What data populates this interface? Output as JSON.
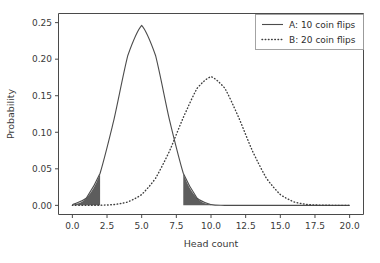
{
  "chart_data": {
    "type": "line",
    "title": "",
    "xlabel": "Head count",
    "ylabel": "Probability",
    "xlim": [
      -1.0,
      21.0
    ],
    "ylim": [
      -0.0125,
      0.2625
    ],
    "grid": false,
    "legend_position": "upper right",
    "xticks": [
      "0.0",
      "2.5",
      "5.0",
      "7.5",
      "10.0",
      "12.5",
      "15.0",
      "17.5",
      "20.0"
    ],
    "xtick_values": [
      0.0,
      2.5,
      5.0,
      7.5,
      10.0,
      12.5,
      15.0,
      17.5,
      20.0
    ],
    "yticks": [
      "0.00",
      "0.05",
      "0.10",
      "0.15",
      "0.20",
      "0.25"
    ],
    "ytick_values": [
      0.0,
      0.05,
      0.1,
      0.15,
      0.2,
      0.25
    ],
    "series": [
      {
        "name": "A: 10 coin flips",
        "style": "solid",
        "color": "#4c4c4c",
        "x": [
          0,
          1,
          2,
          3,
          4,
          5,
          6,
          7,
          8,
          9,
          10,
          11,
          12,
          13,
          14,
          15,
          16,
          17,
          18,
          19,
          20
        ],
        "values": [
          0.000977,
          0.009766,
          0.043945,
          0.117188,
          0.205078,
          0.246094,
          0.205078,
          0.117188,
          0.043945,
          0.009766,
          0.000977,
          0,
          0,
          0,
          0,
          0,
          0,
          0,
          0,
          0,
          0
        ]
      },
      {
        "name": "B: 20 coin flips",
        "style": "dotted",
        "color": "#3d3d3d",
        "x": [
          0,
          1,
          2,
          3,
          4,
          5,
          6,
          7,
          8,
          9,
          10,
          11,
          12,
          13,
          14,
          15,
          16,
          17,
          18,
          19,
          20
        ],
        "values": [
          1e-06,
          1.9e-05,
          0.000181,
          0.001087,
          0.004621,
          0.014786,
          0.037003,
          0.073929,
          0.120134,
          0.160179,
          0.176197,
          0.160179,
          0.120134,
          0.073929,
          0.037003,
          0.014786,
          0.004621,
          0.001087,
          0.000181,
          1.9e-05,
          1e-06
        ]
      }
    ],
    "shaded_regions": [
      {
        "series": "A: 10 coin flips",
        "x_from": 0,
        "x_to": 2,
        "color": "#5d5d5d",
        "label": "left-tail"
      },
      {
        "series": "A: 10 coin flips",
        "x_from": 8,
        "x_to": 10,
        "color": "#5d5d5d",
        "label": "right-tail"
      }
    ]
  },
  "legend": {
    "entries": [
      {
        "label": "A: 10 coin flips",
        "style": "solid"
      },
      {
        "label": "B: 20 coin flips",
        "style": "dotted"
      }
    ]
  },
  "axes": {
    "x_label": "Head count",
    "y_label": "Probability"
  }
}
